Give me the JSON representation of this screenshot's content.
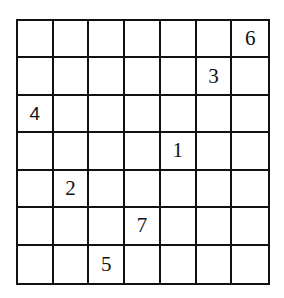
{
  "puzzle": {
    "rows": 7,
    "cols": 7,
    "givens": [
      {
        "row": 0,
        "col": 6,
        "value": "6"
      },
      {
        "row": 1,
        "col": 5,
        "value": "3"
      },
      {
        "row": 2,
        "col": 0,
        "value": "4",
        "style": "sans"
      },
      {
        "row": 3,
        "col": 4,
        "value": "1"
      },
      {
        "row": 4,
        "col": 1,
        "value": "2"
      },
      {
        "row": 5,
        "col": 3,
        "value": "7"
      },
      {
        "row": 6,
        "col": 2,
        "value": "5"
      }
    ]
  }
}
